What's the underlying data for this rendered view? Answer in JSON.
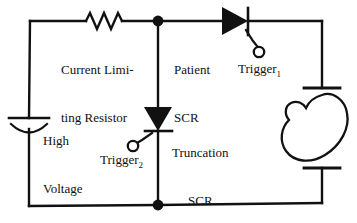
{
  "diagram": {
    "background_color": "#ffffff",
    "line_color": "#111111",
    "labels": {
      "current_limiting_resistor_line1": "Current Limi-",
      "current_limiting_resistor_line2": "ting Resistor",
      "high_voltage_capacitor_line1": "High",
      "high_voltage_capacitor_line2": "Voltage",
      "high_voltage_capacitor_line3": "Capacitor",
      "patient_scr_line1": "Patient",
      "patient_scr_line2": "SCR",
      "truncation_scr_line1": "Truncation",
      "truncation_scr_line2": "SCR",
      "trigger_1_text": "Trigger",
      "trigger_1_subscript": "1",
      "trigger_2_text": "Trigger",
      "trigger_2_subscript": "2"
    },
    "components": [
      {
        "name": "current-limiting-resistor",
        "type": "resistor",
        "symbol": "zigzag"
      },
      {
        "name": "high-voltage-capacitor",
        "type": "capacitor",
        "symbol": "polarized-capacitor"
      },
      {
        "name": "patient-scr",
        "type": "thyristor",
        "symbol": "scr-right"
      },
      {
        "name": "truncation-scr",
        "type": "thyristor",
        "symbol": "scr-down"
      },
      {
        "name": "trigger-1-terminal",
        "type": "terminal",
        "symbol": "open-circle"
      },
      {
        "name": "trigger-2-terminal",
        "type": "terminal",
        "symbol": "open-circle"
      },
      {
        "name": "patient-heart",
        "type": "load",
        "symbol": "heart"
      },
      {
        "name": "upper-electrode-paddle",
        "type": "electrode",
        "symbol": "t-bar"
      },
      {
        "name": "lower-electrode-paddle",
        "type": "electrode",
        "symbol": "t-bar"
      },
      {
        "name": "top-junction-node",
        "type": "node",
        "symbol": "filled-dot"
      },
      {
        "name": "bottom-junction-node",
        "type": "node",
        "symbol": "filled-dot"
      }
    ]
  }
}
